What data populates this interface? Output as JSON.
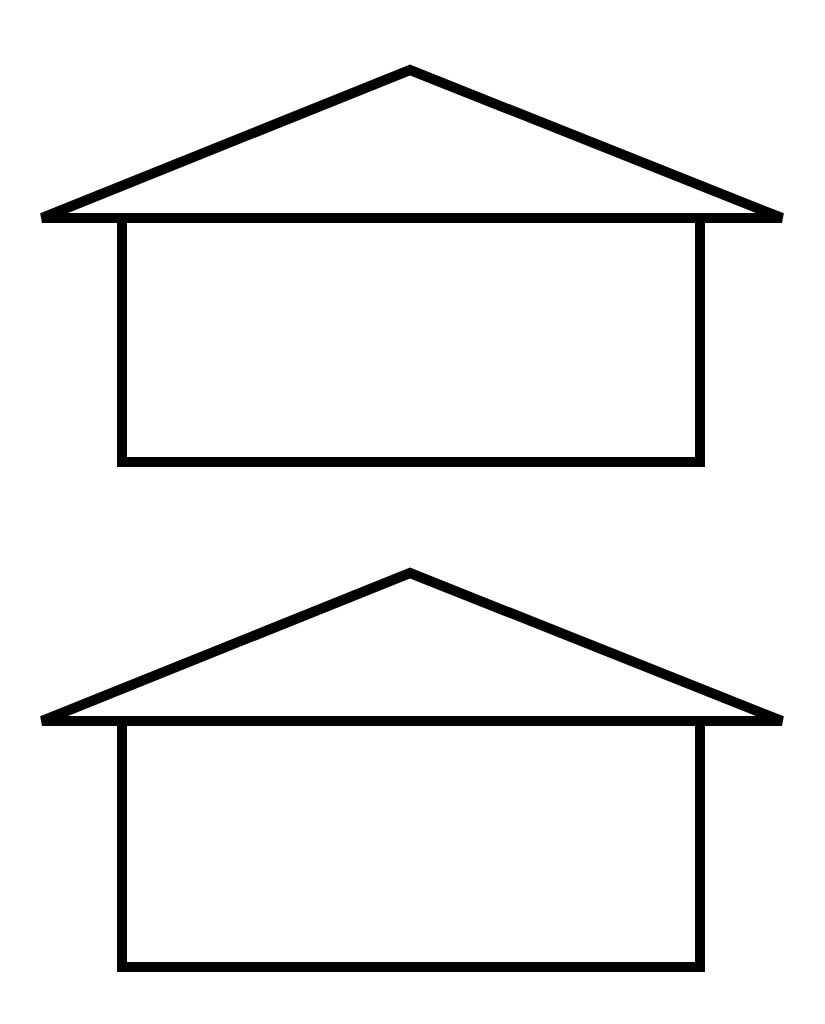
{
  "diagram": {
    "background": "#ffffff",
    "stroke_color": "#000000",
    "stroke_width": 10,
    "houses": [
      {
        "name": "house-top",
        "peak": [
          410,
          70
        ],
        "eave_left": [
          42,
          218
        ],
        "eave_right": [
          782,
          218
        ],
        "wall": {
          "x": 122,
          "y": 218,
          "width": 578,
          "height": 244
        }
      },
      {
        "name": "house-bottom",
        "peak": [
          410,
          573
        ],
        "eave_left": [
          42,
          721
        ],
        "eave_right": [
          782,
          721
        ],
        "wall": {
          "x": 122,
          "y": 721,
          "width": 578,
          "height": 246
        }
      }
    ]
  }
}
